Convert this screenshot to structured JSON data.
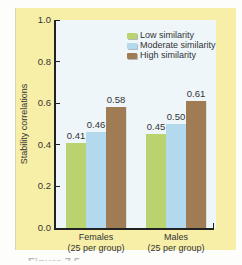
{
  "chart_data": {
    "type": "bar",
    "title": "",
    "xlabel": "",
    "ylabel": "Stability correlations",
    "ylim": [
      0.0,
      1.0
    ],
    "yticks": [
      "0.0",
      "0.2",
      "0.4",
      "0.6",
      "0.8",
      "1.0"
    ],
    "categories": [
      "Females",
      "Males"
    ],
    "category_sublabels": [
      "(25 per group)",
      "(25 per group)"
    ],
    "series": [
      {
        "name": "Low similarity",
        "values": [
          0.41,
          0.45
        ],
        "color": "#b9d36e"
      },
      {
        "name": "Moderate similarity",
        "values": [
          0.46,
          0.5
        ],
        "color": "#b3d9ef"
      },
      {
        "name": "High similarity",
        "values": [
          0.58,
          0.61
        ],
        "color": "#a07c55"
      }
    ],
    "value_labels": [
      [
        "0.41",
        "0.46",
        "0.58"
      ],
      [
        "0.45",
        "0.50",
        "0.61"
      ]
    ],
    "legend_position": "top-right inside",
    "grid": false
  },
  "colors": {
    "frame_bg": "#f7efa8",
    "plot_bg": "#eef6fa",
    "low": "#b9d36e",
    "moderate": "#b3d9ef",
    "high": "#a07c55"
  },
  "caption": "Figure 7.5"
}
